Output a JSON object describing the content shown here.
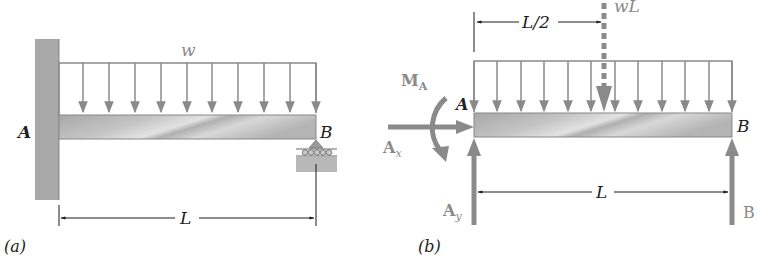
{
  "figure_a": {
    "caption": "(a)",
    "load_label": "w",
    "point_a_label": "A",
    "point_b_label": "B",
    "length_label": "L",
    "load_arrow_count": 10
  },
  "figure_b": {
    "caption": "(b)",
    "resultant_label": "wL",
    "half_length_label": "L/2",
    "length_label": "L",
    "point_a_label": "A",
    "point_b_label": "B",
    "moment_label": "M",
    "moment_sub": "A",
    "ax_label": "A",
    "ax_sub": "x",
    "ay_label": "A",
    "ay_sub": "y",
    "b_reaction_label": "B",
    "load_arrow_count": 12
  },
  "colors": {
    "force_gray": "#8a8a8a",
    "beam_gray": "#b8b8b8",
    "wall_gray": "#a8a8a8",
    "line_black": "#1a1a1a",
    "label_gray": "#7a7a7a"
  }
}
